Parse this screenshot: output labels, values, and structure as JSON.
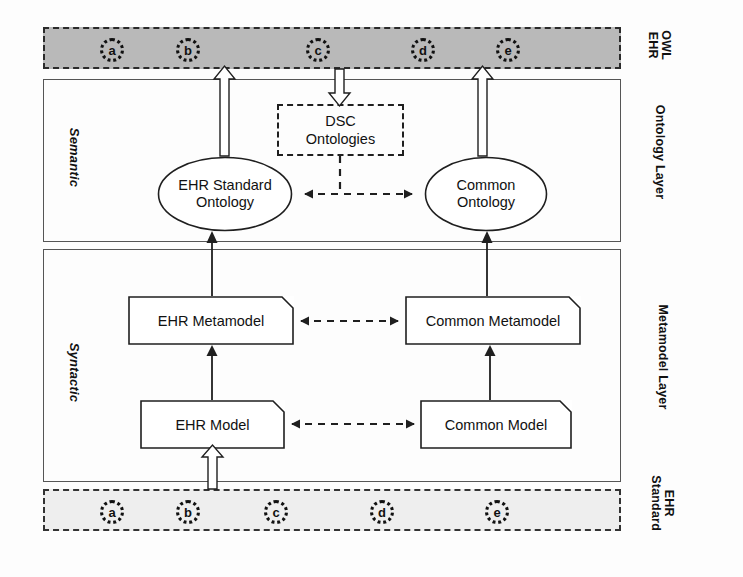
{
  "figure": {
    "type": "layered-architecture-diagram",
    "background": "#fdfdfd"
  },
  "colors": {
    "band_owl_fill": "#b9b9b9",
    "band_standard_fill": "#eeeeee",
    "stroke": "#1f1f1f",
    "layer_stroke": "#555555",
    "box_fill": "#ffffff"
  },
  "bands": {
    "owl_ehr": {
      "side_label_line1": "OWL",
      "side_label_line2": "EHR",
      "items": [
        {
          "letter": "a"
        },
        {
          "letter": "b"
        },
        {
          "letter": "c"
        },
        {
          "letter": "d"
        },
        {
          "letter": "e"
        }
      ]
    },
    "ehr_standard": {
      "side_label_line1": "EHR",
      "side_label_line2": "Standard",
      "items": [
        {
          "letter": "a"
        },
        {
          "letter": "b"
        },
        {
          "letter": "c"
        },
        {
          "letter": "d"
        },
        {
          "letter": "e"
        }
      ]
    }
  },
  "layers": {
    "ontology": {
      "side_label": "Ontology Layer",
      "left_label": "Semantic",
      "nodes": {
        "dsc": {
          "line1": "DSC",
          "line2": "Ontologies"
        },
        "ehr_standard_ontology": {
          "line1": "EHR Standard",
          "line2": "Ontology"
        },
        "common_ontology": {
          "line1": "Common",
          "line2": "Ontology"
        }
      }
    },
    "metamodel": {
      "side_label": "Metamodel Layer",
      "left_label": "Syntactic",
      "nodes": {
        "ehr_metamodel": {
          "label": "EHR Metamodel"
        },
        "common_metamodel": {
          "label": "Common Metamodel"
        },
        "ehr_model": {
          "label": "EHR Model"
        },
        "common_model": {
          "label": "Common Model"
        }
      }
    }
  },
  "connectors": [
    {
      "name": "ehr-standard-to-ehr-model",
      "style": "hollow-block-arrow",
      "direction": "up"
    },
    {
      "name": "ehr-model-to-ehr-metamodel",
      "style": "solid-arrow",
      "direction": "up"
    },
    {
      "name": "common-model-to-common-metamodel",
      "style": "solid-arrow",
      "direction": "up"
    },
    {
      "name": "ehr-metamodel-to-ehr-standard-ontology",
      "style": "solid-arrow",
      "direction": "up"
    },
    {
      "name": "common-metamodel-to-common-ontology",
      "style": "solid-arrow",
      "direction": "up"
    },
    {
      "name": "ehr-standard-ontology-to-owl-ehr",
      "style": "hollow-block-arrow",
      "direction": "up"
    },
    {
      "name": "common-ontology-to-owl-ehr",
      "style": "hollow-block-arrow",
      "direction": "up"
    },
    {
      "name": "owl-ehr-to-dsc-ontologies",
      "style": "hollow-block-arrow",
      "direction": "down"
    },
    {
      "name": "ehr-model-common-model",
      "style": "dashed-bidirectional"
    },
    {
      "name": "ehr-metamodel-common-metamodel",
      "style": "dashed-bidirectional"
    },
    {
      "name": "ehr-standard-ontology-common-ontology",
      "style": "dashed-bidirectional"
    },
    {
      "name": "dsc-to-ontology-link",
      "style": "dashed-line",
      "direction": "down"
    }
  ]
}
